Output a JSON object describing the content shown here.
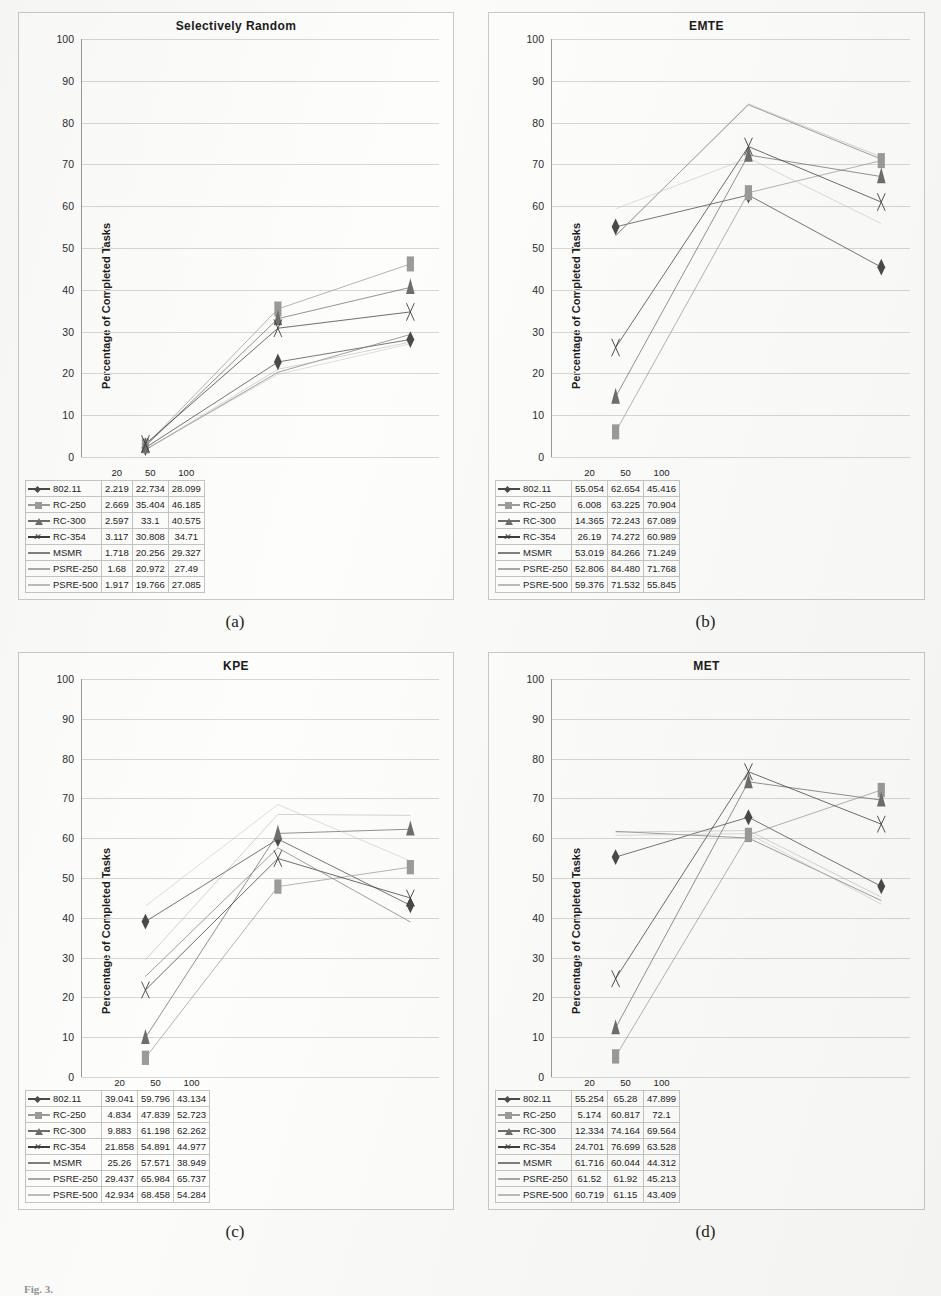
{
  "figure": {
    "caption": "Fig. 3.",
    "y_axis_label": "Percentage of Completed Tasks",
    "y_ticks": [
      "100",
      "90",
      "80",
      "70",
      "60",
      "50",
      "40",
      "30",
      "20",
      "10",
      "0"
    ],
    "x_categories": [
      "20",
      "50",
      "100"
    ],
    "series_names": [
      "802.11",
      "RC-250",
      "RC-300",
      "RC-354",
      "MSMR",
      "PSRE-250",
      "PSRE-500"
    ],
    "series_markers": [
      "diamond",
      "square",
      "triangle",
      "x",
      "line",
      "line",
      "line"
    ],
    "series_colors": [
      "#4a4a4a",
      "#9b9b9b",
      "#6e6e6e",
      "#3d3d3d",
      "#7f7f7f",
      "#a9a9a9",
      "#bcbcbc"
    ]
  },
  "panels": [
    {
      "sublabel": "(a)",
      "title": "Selectively Random",
      "chart_data": {
        "type": "line",
        "title": "Selectively Random",
        "xlabel": "",
        "ylabel": "Percentage of Completed Tasks",
        "categories": [
          "20",
          "50",
          "100"
        ],
        "ylim": [
          0,
          100
        ],
        "grid": true,
        "legend": "bottom-table",
        "series": [
          {
            "name": "802.11",
            "values": [
              2.219,
              22.734,
              28.099
            ]
          },
          {
            "name": "RC-250",
            "values": [
              2.669,
              35.404,
              46.185
            ]
          },
          {
            "name": "RC-300",
            "values": [
              2.597,
              33.1,
              40.575
            ]
          },
          {
            "name": "RC-354",
            "values": [
              3.117,
              30.808,
              34.71
            ]
          },
          {
            "name": "MSMR",
            "values": [
              1.718,
              20.256,
              29.327
            ]
          },
          {
            "name": "PSRE-250",
            "values": [
              1.68,
              20.972,
              27.49
            ]
          },
          {
            "name": "PSRE-500",
            "values": [
              1.917,
              19.766,
              27.085
            ]
          }
        ]
      },
      "table": {
        "headers": [
          "",
          "20",
          "50",
          "100"
        ],
        "rows": [
          {
            "label": "802.11",
            "cells": [
              "2.219",
              "22.734",
              "28.099"
            ]
          },
          {
            "label": "RC-250",
            "cells": [
              "2.669",
              "35.404",
              "46.185"
            ]
          },
          {
            "label": "RC-300",
            "cells": [
              "2.597",
              "33.1",
              "40.575"
            ]
          },
          {
            "label": "RC-354",
            "cells": [
              "3.117",
              "30.808",
              "34.71"
            ]
          },
          {
            "label": "MSMR",
            "cells": [
              "1.718",
              "20.256",
              "29.327"
            ]
          },
          {
            "label": "PSRE-250",
            "cells": [
              "1.68",
              "20.972",
              "27.49"
            ]
          },
          {
            "label": "PSRE-500",
            "cells": [
              "1.917",
              "19.766",
              "27.085"
            ]
          }
        ]
      }
    },
    {
      "sublabel": "(b)",
      "title": "EMTE",
      "chart_data": {
        "type": "line",
        "title": "EMTE",
        "xlabel": "",
        "ylabel": "Percentage of Completed Tasks",
        "categories": [
          "20",
          "50",
          "100"
        ],
        "ylim": [
          0,
          100
        ],
        "grid": true,
        "legend": "bottom-table",
        "series": [
          {
            "name": "802.11",
            "values": [
              55.054,
              62.654,
              45.416
            ]
          },
          {
            "name": "RC-250",
            "values": [
              6.008,
              63.225,
              70.904
            ]
          },
          {
            "name": "RC-300",
            "values": [
              14.365,
              72.243,
              67.089
            ]
          },
          {
            "name": "RC-354",
            "values": [
              26.19,
              74.272,
              60.989
            ]
          },
          {
            "name": "MSMR",
            "values": [
              53.019,
              84.266,
              71.249
            ]
          },
          {
            "name": "PSRE-250",
            "values": [
              52.806,
              84.48,
              71.768
            ]
          },
          {
            "name": "PSRE-500",
            "values": [
              59.376,
              71.532,
              55.845
            ]
          }
        ]
      },
      "table": {
        "headers": [
          "",
          "20",
          "50",
          "100"
        ],
        "rows": [
          {
            "label": "802.11",
            "cells": [
              "55.054",
              "62.654",
              "45.416"
            ]
          },
          {
            "label": "RC-250",
            "cells": [
              "6.008",
              "63.225",
              "70.904"
            ]
          },
          {
            "label": "RC-300",
            "cells": [
              "14.365",
              "72.243",
              "67.089"
            ]
          },
          {
            "label": "RC-354",
            "cells": [
              "26.19",
              "74.272",
              "60.989"
            ]
          },
          {
            "label": "MSMR",
            "cells": [
              "53.019",
              "84.266",
              "71.249"
            ]
          },
          {
            "label": "PSRE-250",
            "cells": [
              "52.806",
              "84.480",
              "71.768"
            ]
          },
          {
            "label": "PSRE-500",
            "cells": [
              "59.376",
              "71.532",
              "55.845"
            ]
          }
        ]
      }
    },
    {
      "sublabel": "(c)",
      "title": "KPE",
      "chart_data": {
        "type": "line",
        "title": "KPE",
        "xlabel": "",
        "ylabel": "Percentage of Completed Tasks",
        "categories": [
          "20",
          "50",
          "100"
        ],
        "ylim": [
          0,
          100
        ],
        "grid": true,
        "legend": "bottom-table",
        "series": [
          {
            "name": "802.11",
            "values": [
              39.041,
              59.796,
              43.134
            ]
          },
          {
            "name": "RC-250",
            "values": [
              4.834,
              47.839,
              52.723
            ]
          },
          {
            "name": "RC-300",
            "values": [
              9.883,
              61.198,
              62.262
            ]
          },
          {
            "name": "RC-354",
            "values": [
              21.858,
              54.891,
              44.977
            ]
          },
          {
            "name": "MSMR",
            "values": [
              25.26,
              57.571,
              38.949
            ]
          },
          {
            "name": "PSRE-250",
            "values": [
              29.437,
              65.984,
              65.737
            ]
          },
          {
            "name": "PSRE-500",
            "values": [
              42.934,
              68.458,
              54.284
            ]
          }
        ]
      },
      "table": {
        "headers": [
          "",
          "20",
          "50",
          "100"
        ],
        "rows": [
          {
            "label": "802.11",
            "cells": [
              "39.041",
              "59.796",
              "43.134"
            ]
          },
          {
            "label": "RC-250",
            "cells": [
              "4.834",
              "47.839",
              "52.723"
            ]
          },
          {
            "label": "RC-300",
            "cells": [
              "9.883",
              "61.198",
              "62.262"
            ]
          },
          {
            "label": "RC-354",
            "cells": [
              "21.858",
              "54.891",
              "44.977"
            ]
          },
          {
            "label": "MSMR",
            "cells": [
              "25.26",
              "57.571",
              "38.949"
            ]
          },
          {
            "label": "PSRE-250",
            "cells": [
              "29.437",
              "65.984",
              "65.737"
            ]
          },
          {
            "label": "PSRE-500",
            "cells": [
              "42.934",
              "68.458",
              "54.284"
            ]
          }
        ]
      }
    },
    {
      "sublabel": "(d)",
      "title": "MET",
      "chart_data": {
        "type": "line",
        "title": "MET",
        "xlabel": "",
        "ylabel": "Percentage of Completed Tasks",
        "categories": [
          "20",
          "50",
          "100"
        ],
        "ylim": [
          0,
          100
        ],
        "grid": true,
        "legend": "bottom-table",
        "series": [
          {
            "name": "802.11",
            "values": [
              55.254,
              65.28,
              47.899
            ]
          },
          {
            "name": "RC-250",
            "values": [
              5.174,
              60.817,
              72.1
            ]
          },
          {
            "name": "RC-300",
            "values": [
              12.334,
              74.164,
              69.564
            ]
          },
          {
            "name": "RC-354",
            "values": [
              24.701,
              76.699,
              63.528
            ]
          },
          {
            "name": "MSMR",
            "values": [
              61.716,
              60.044,
              44.312
            ]
          },
          {
            "name": "PSRE-250",
            "values": [
              61.52,
              61.92,
              45.213
            ]
          },
          {
            "name": "PSRE-500",
            "values": [
              60.719,
              61.15,
              43.409
            ]
          }
        ]
      },
      "table": {
        "headers": [
          "",
          "20",
          "50",
          "100"
        ],
        "rows": [
          {
            "label": "802.11",
            "cells": [
              "55.254",
              "65.28",
              "47.899"
            ]
          },
          {
            "label": "RC-250",
            "cells": [
              "5.174",
              "60.817",
              "72.1"
            ]
          },
          {
            "label": "RC-300",
            "cells": [
              "12.334",
              "74.164",
              "69.564"
            ]
          },
          {
            "label": "RC-354",
            "cells": [
              "24.701",
              "76.699",
              "63.528"
            ]
          },
          {
            "label": "MSMR",
            "cells": [
              "61.716",
              "60.044",
              "44.312"
            ]
          },
          {
            "label": "PSRE-250",
            "cells": [
              "61.52",
              "61.92",
              "45.213"
            ]
          },
          {
            "label": "PSRE-500",
            "cells": [
              "60.719",
              "61.15",
              "43.409"
            ]
          }
        ]
      }
    }
  ]
}
